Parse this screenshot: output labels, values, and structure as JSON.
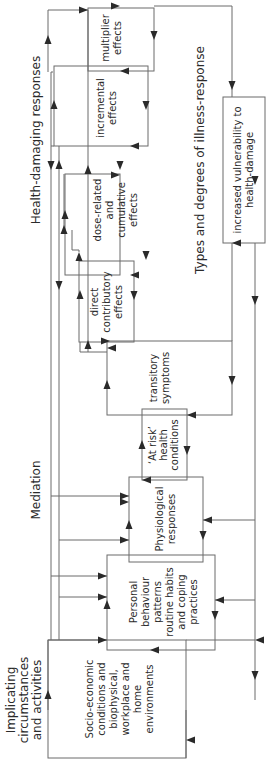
{
  "diagram": {
    "orientation": "rotated-90-ccw",
    "sections": [
      {
        "id": "implicating",
        "lines": [
          "Implicating",
          "circumstances",
          "and activities"
        ]
      },
      {
        "id": "mediation",
        "lines": [
          "Mediation"
        ]
      },
      {
        "id": "health-damaging",
        "lines": [
          "Health-damaging responses"
        ]
      },
      {
        "id": "illness-response",
        "lines": [
          "Types and degrees of illness-response"
        ]
      }
    ],
    "boxes": [
      {
        "id": "socio-economic",
        "lines": [
          "Socio-economic",
          "conditions and",
          "biophysical,",
          "workplace and",
          "home",
          "environments"
        ]
      },
      {
        "id": "personal-behaviour",
        "lines": [
          "Personal",
          "behaviour",
          "patterns",
          "routine habits",
          "and coping",
          "practices"
        ]
      },
      {
        "id": "physiological",
        "lines": [
          "Physiological",
          "responses"
        ]
      },
      {
        "id": "at-risk",
        "lines": [
          "‘At risk’",
          "health",
          "conditions"
        ]
      },
      {
        "id": "transitory",
        "lines": [
          "transitory",
          "symptoms"
        ]
      },
      {
        "id": "direct-contributory",
        "lines": [
          "direct",
          "contributory",
          "effects"
        ]
      },
      {
        "id": "dose-related",
        "lines": [
          "dose-related",
          "and",
          "cumulative",
          "effects"
        ]
      },
      {
        "id": "incremental",
        "lines": [
          "incremental",
          "effects"
        ]
      },
      {
        "id": "multiplier",
        "lines": [
          "multiplier",
          "effects"
        ]
      },
      {
        "id": "vulnerability",
        "lines": [
          "increased vulnerability to",
          "health-damage"
        ]
      }
    ],
    "colors": {
      "line": "#6b6b6b",
      "arrow": "#2a2a2a",
      "text": "#2b2b2b",
      "background": "#ffffff"
    }
  }
}
